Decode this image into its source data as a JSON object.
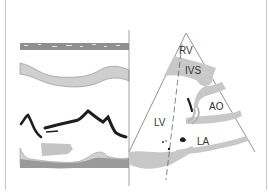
{
  "figure": {
    "type": "echocardiography-schematic",
    "left_panel": {
      "name": "M-mode trace",
      "layers": [
        "RV wall",
        "Interventricular septum",
        "Mitral valve leaflets",
        "Posterior wall",
        "Pericardium"
      ]
    },
    "right_panel": {
      "name": "Parasternal long-axis view",
      "labels": {
        "rv": "RV",
        "ivs": "IVS",
        "ao": "AO",
        "lv": "LV",
        "la": "LA"
      }
    }
  },
  "colors": {
    "tissue_light": "#c8c8c8",
    "tissue_dark": "#9a9a9a",
    "leaflet": "#1e1e1e",
    "line": "#777777",
    "background": "#ffffff"
  }
}
